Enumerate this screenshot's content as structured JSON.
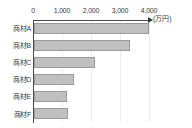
{
  "chart_data": {
    "type": "bar",
    "orientation": "horizontal",
    "title": "",
    "subtitle": "",
    "xlabel": "",
    "ylabel": "",
    "unit_label": "(万円)",
    "categories": [
      "商材A",
      "商材B",
      "商材C",
      "商材D",
      "商材E",
      "商材F"
    ],
    "values": [
      3950,
      3300,
      2100,
      1380,
      1150,
      1170
    ],
    "series": [
      {
        "name": "売上",
        "values": [
          3950,
          3300,
          2100,
          1380,
          1150,
          1170
        ]
      }
    ],
    "xlim": [
      0,
      4000
    ],
    "ylim": [
      0,
      6
    ],
    "xticks": [
      0,
      1000,
      2000,
      3000,
      4000
    ],
    "xtick_labels": [
      "0",
      "1,000",
      "2,000",
      "3,000",
      "4,000"
    ],
    "grid": true,
    "grid_axis": "x",
    "legend": false,
    "legend_position": "none",
    "axis_position": "top",
    "annotations": [],
    "colors": {
      "bar_fill": "#c0c0c0",
      "bar_stroke": "#9a9a9a",
      "axis": "#4a4a4a",
      "grid": "#ededed",
      "text": "#3b3b3b",
      "background": "#ffffff"
    }
  }
}
